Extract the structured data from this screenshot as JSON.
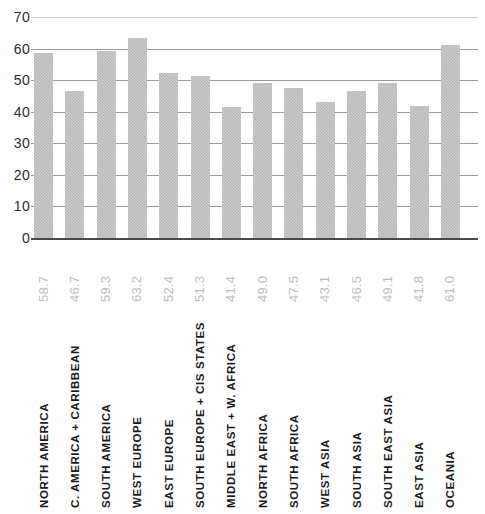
{
  "chart_data": {
    "type": "bar",
    "title": "",
    "subtitle": "",
    "xlabel": "",
    "ylabel": "",
    "ylim": [
      0,
      70
    ],
    "ytick_step": 10,
    "ytick_labels": [
      "70",
      "60",
      "50",
      "40",
      "30",
      "20",
      "10",
      "0"
    ],
    "grid": true,
    "legend": false,
    "bar_color": "#b3b3b3",
    "value_label_color": "#bcbcbc",
    "category_label_color": "#1a1a1a",
    "axis_label_color": "#2b2b2b",
    "gridline_color": "#9a9a9a",
    "baseline_color": "#4a4a4a",
    "categories": [
      "NORTH AMERICA",
      "C. AMERICA + CARIBBEAN",
      "SOUTH AMERICA",
      "WEST EUROPE",
      "EAST EUROPE",
      "SOUTH EUROPE + CIS STATES",
      "MIDDLE EAST + W. AFRICA",
      "NORTH AFRICA",
      "SOUTH AFRICA",
      "WEST ASIA",
      "SOUTH ASIA",
      "SOUTH EAST ASIA",
      "EAST ASIA",
      "OCEANIA"
    ],
    "values": [
      58.7,
      46.7,
      59.3,
      63.2,
      52.4,
      51.3,
      41.4,
      49.0,
      47.5,
      43.1,
      46.5,
      49.1,
      41.8,
      61.0
    ],
    "value_labels": [
      "58.7",
      "46.7",
      "59.3",
      "63.2",
      "52.4",
      "51.3",
      "41.4",
      "49.0",
      "47.5",
      "43.1",
      "46.5",
      "49.1",
      "41.8",
      "61.0"
    ]
  }
}
